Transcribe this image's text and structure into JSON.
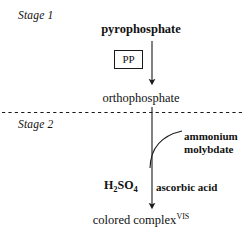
{
  "diagram": {
    "background_color": "#ffffff",
    "line_color": "#1a1a1a",
    "width": 246,
    "height": 242,
    "stages": [
      {
        "id": "stage-1",
        "label": "Stage 1"
      },
      {
        "id": "stage-2",
        "label": "Stage 2"
      }
    ],
    "nodes": [
      {
        "id": "pyrophosphate",
        "label": "pyrophosphate",
        "weight": "bold"
      },
      {
        "id": "orthophosphate",
        "label": "orthophosphate",
        "weight": "normal"
      },
      {
        "id": "colored-complex",
        "label": "colored complex",
        "superscript": "VIS",
        "weight": "normal"
      }
    ],
    "enzyme_box": {
      "id": "pp-box",
      "label": "PP"
    },
    "reagents": [
      {
        "id": "ammonium-molybdate",
        "line1": "ammonium",
        "line2": "molybdate"
      },
      {
        "id": "h2so4",
        "formula_main": "H",
        "sub1": "2",
        "formula_mid": "SO",
        "sub2": "4"
      },
      {
        "id": "ascorbic-acid",
        "label": "ascorbic acid"
      }
    ],
    "divider": {
      "id": "stage-divider",
      "style": "dashed"
    },
    "arrows": [
      {
        "id": "arrow-stage-1",
        "from": "pyrophosphate",
        "to": "orthophosphate",
        "direction": "down"
      },
      {
        "id": "arrow-stage-2",
        "from": "orthophosphate",
        "to": "colored-complex",
        "direction": "down"
      },
      {
        "id": "arrow-reagent-curve",
        "from": "ammonium-molybdate",
        "to": "arrow-stage-2",
        "direction": "curve"
      }
    ]
  }
}
